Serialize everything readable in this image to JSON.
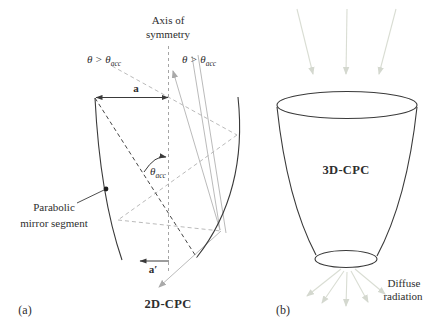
{
  "figure": {
    "background_color": "#ffffff",
    "outline_color": "#3a3a3a",
    "ray_color": "#b2b2b2",
    "diffuse_ray_color": "#d9ddd3",
    "panel_a": {
      "tag": "(a)",
      "title": "2D-CPC",
      "axis_label": {
        "line1": "Axis of",
        "line2": "symmetry"
      },
      "ray_label_left": {
        "prefix": "θ > θ",
        "sub": "acc"
      },
      "ray_label_right": {
        "prefix": "θ > θ",
        "sub": "acc"
      },
      "acceptance_angle_label": {
        "prefix": "θ",
        "sub": "acc"
      },
      "entry_aperture_label": "a",
      "exit_aperture_label": "a′",
      "mirror_label": {
        "line1": "Parabolic",
        "line2": "mirror segment"
      }
    },
    "panel_b": {
      "tag": "(b)",
      "title": "3D-CPC",
      "diffuse_label": {
        "line1": "Diffuse",
        "line2": "radiation"
      }
    }
  }
}
